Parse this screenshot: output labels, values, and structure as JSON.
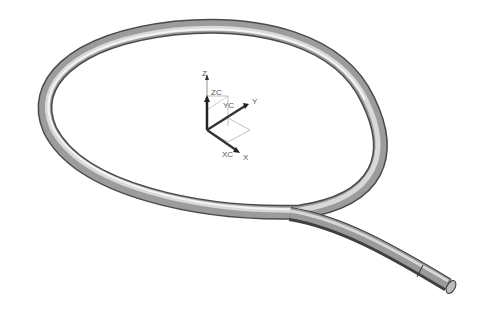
{
  "viewport": {
    "background": "#ffffff",
    "model": {
      "name": "swept-tube-loop",
      "color_light": "#e6e6e6",
      "color_dark": "#555555"
    },
    "wcs_axes": {
      "z_label": "Z",
      "y_label": "Y",
      "x_label": "X"
    },
    "work_csys": {
      "zc_label": "ZC",
      "yc_label": "YC",
      "xc_label": "XC"
    }
  }
}
